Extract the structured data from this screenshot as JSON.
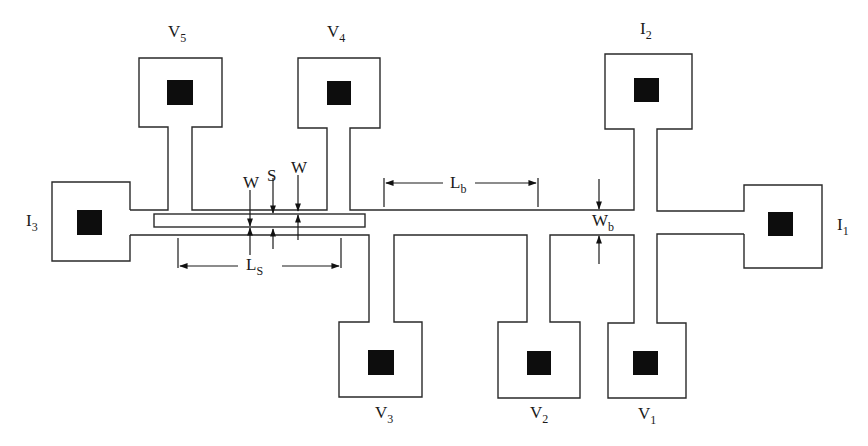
{
  "diagram": {
    "type": "hall-bar-device-layout",
    "pads": [
      {
        "id": "V5",
        "label": "V",
        "subscript": "5"
      },
      {
        "id": "V4",
        "label": "V",
        "subscript": "4"
      },
      {
        "id": "I2",
        "label": "I",
        "subscript": "2"
      },
      {
        "id": "I3",
        "label": "I",
        "subscript": "3"
      },
      {
        "id": "I1",
        "label": "I",
        "subscript": "1"
      },
      {
        "id": "V3",
        "label": "V",
        "subscript": "3"
      },
      {
        "id": "V2",
        "label": "V",
        "subscript": "2"
      },
      {
        "id": "V1",
        "label": "V",
        "subscript": "1"
      }
    ],
    "dimensions": {
      "w_top": {
        "label": "W"
      },
      "s": {
        "label": "S"
      },
      "w_right": {
        "label": "W"
      },
      "ls": {
        "label": "L",
        "subscript": "S"
      },
      "lb": {
        "label": "L",
        "subscript": "b"
      },
      "wb": {
        "label": "W",
        "subscript": "b"
      }
    },
    "colors": {
      "outline": "#2a2a2a",
      "contact": "#0d0d0d",
      "background": "#ffffff"
    }
  }
}
